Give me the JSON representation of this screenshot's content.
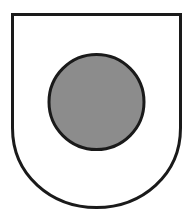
{
  "figure": {
    "shield": {
      "fill": "#ffffff",
      "stroke": "#1a1a1a",
      "stroke_width": 3
    },
    "roundel": {
      "fill": "#8c8c8c",
      "stroke": "#1a1a1a",
      "stroke_width": 3
    }
  }
}
